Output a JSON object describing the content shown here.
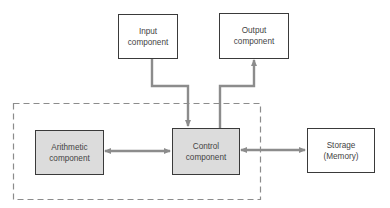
{
  "diagram": {
    "title": "",
    "colors": {
      "arrow": "#8c8c8c",
      "box_border": "#3a3a3a",
      "shaded_fill": "#dcdcdc",
      "dashed": "#8c8c8c"
    },
    "nodes": {
      "input": {
        "label": "Input\ncomponent",
        "shaded": false
      },
      "output": {
        "label": "Output\ncomponent",
        "shaded": false
      },
      "arithmetic": {
        "label": "Arithmetic\ncomponent",
        "shaded": true
      },
      "control": {
        "label": "Control\ncomponent",
        "shaded": true
      },
      "storage": {
        "label": "Storage\n(Memory)",
        "shaded": false
      }
    },
    "edges": [
      {
        "from": "input",
        "to": "control",
        "direction": "one-way"
      },
      {
        "from": "control",
        "to": "output",
        "direction": "one-way"
      },
      {
        "from": "arithmetic",
        "to": "control",
        "direction": "two-way"
      },
      {
        "from": "control",
        "to": "storage",
        "direction": "two-way"
      }
    ],
    "group": {
      "members": [
        "arithmetic",
        "control"
      ],
      "style": "dashed"
    }
  }
}
